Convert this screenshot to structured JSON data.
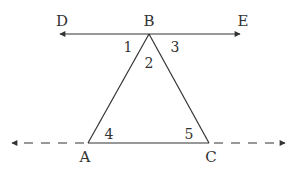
{
  "diagram": {
    "type": "geometry",
    "stroke_color": "#333333",
    "points": {
      "D": {
        "label": "D",
        "x": 60,
        "y": 34,
        "lx": 62,
        "ly": 26
      },
      "B": {
        "label": "B",
        "x": 149,
        "y": 34,
        "lx": 149,
        "ly": 26
      },
      "E": {
        "label": "E",
        "x": 240,
        "y": 34,
        "lx": 243,
        "ly": 26
      },
      "A": {
        "label": "A",
        "x": 88,
        "y": 143,
        "lx": 85,
        "ly": 162
      },
      "C": {
        "label": "C",
        "x": 209,
        "y": 143,
        "lx": 211,
        "ly": 162
      }
    },
    "angles": [
      {
        "label": "1",
        "x": 128,
        "y": 51
      },
      {
        "label": "2",
        "x": 149,
        "y": 67
      },
      {
        "label": "3",
        "x": 175,
        "y": 51
      },
      {
        "label": "4",
        "x": 109,
        "y": 138
      },
      {
        "label": "5",
        "x": 189,
        "y": 138
      }
    ],
    "lines": [
      {
        "name": "line-DE",
        "from": "D",
        "to": "E",
        "style": "solid",
        "arrows": "both"
      },
      {
        "name": "segment-BA",
        "from": "B",
        "to": "A",
        "style": "solid"
      },
      {
        "name": "segment-BC",
        "from": "B",
        "to": "C",
        "style": "solid"
      },
      {
        "name": "segment-AC",
        "from": "A",
        "to": "C",
        "style": "solid"
      },
      {
        "name": "line-AC-extension-left",
        "style": "dashed",
        "arrows": "left"
      },
      {
        "name": "line-AC-extension-right",
        "style": "dashed",
        "arrows": "right"
      }
    ]
  }
}
